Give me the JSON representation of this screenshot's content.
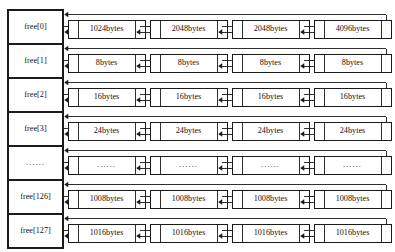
{
  "diagram": {
    "type": "linked-list-array",
    "colors": {
      "stroke": "#1a1a1a",
      "background": "#ffffff",
      "text": "#111111"
    },
    "array": {
      "name": "free",
      "cell_count": 7,
      "cells": [
        {
          "label": "free[0]",
          "is_ellipsis": false
        },
        {
          "label": "free[1]",
          "is_ellipsis": false
        },
        {
          "label": "free[2]",
          "is_ellipsis": false
        },
        {
          "label": "free[3]",
          "is_ellipsis": false
        },
        {
          "label": "......",
          "is_ellipsis": true
        },
        {
          "label": "free[126]",
          "is_ellipsis": false
        },
        {
          "label": "free[127]",
          "is_ellipsis": false
        }
      ]
    },
    "rows": [
      {
        "index_label": "free[0]",
        "nodes": [
          {
            "size": "1024bytes"
          },
          {
            "size": "2048bytes"
          },
          {
            "size": "2048bytes"
          },
          {
            "size": "4096bytes"
          }
        ]
      },
      {
        "index_label": "free[1]",
        "nodes": [
          {
            "size": "8bytes"
          },
          {
            "size": "8bytes"
          },
          {
            "size": "8bytes"
          },
          {
            "size": "8bytes"
          }
        ]
      },
      {
        "index_label": "free[2]",
        "nodes": [
          {
            "size": "16bytes"
          },
          {
            "size": "16bytes"
          },
          {
            "size": "16bytes"
          },
          {
            "size": "16bytes"
          }
        ]
      },
      {
        "index_label": "free[3]",
        "nodes": [
          {
            "size": "24bytes"
          },
          {
            "size": "24bytes"
          },
          {
            "size": "24bytes"
          },
          {
            "size": "24bytes"
          }
        ]
      },
      {
        "index_label": "......",
        "nodes": [
          {
            "size": "......"
          },
          {
            "size": "......"
          },
          {
            "size": "......"
          },
          {
            "size": "......"
          }
        ]
      },
      {
        "index_label": "free[126]",
        "nodes": [
          {
            "size": "1008bytes"
          },
          {
            "size": "1008bytes"
          },
          {
            "size": "1008bytes"
          },
          {
            "size": "1008bytes"
          }
        ]
      },
      {
        "index_label": "free[127]",
        "nodes": [
          {
            "size": "1016bytes"
          },
          {
            "size": "1016bytes"
          },
          {
            "size": "1016bytes"
          },
          {
            "size": "1016bytes"
          }
        ]
      }
    ]
  }
}
